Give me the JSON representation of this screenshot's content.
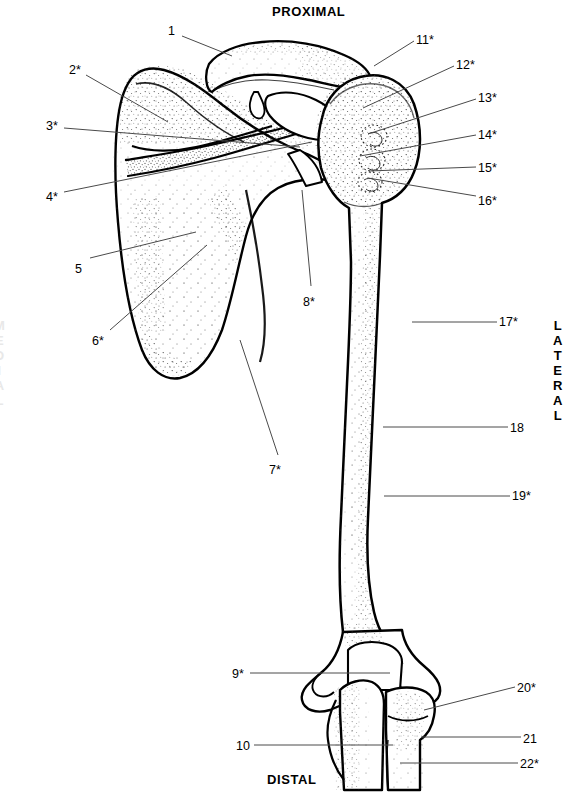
{
  "figure": {
    "title_orientation_top": "PROXIMAL",
    "title_orientation_bottom": "DISTAL",
    "orientation_right": "LATERAL",
    "orientation_left": "MEDIAL",
    "ink_color": "#000000",
    "background_color": "#ffffff"
  },
  "callouts": [
    {
      "id": "c1",
      "label": "1",
      "x": 168,
      "y": 24,
      "leader": [
        [
          182,
          36
        ],
        [
          232,
          56
        ]
      ]
    },
    {
      "id": "c2",
      "label": "2*",
      "x": 69,
      "y": 63,
      "leader": [
        [
          86,
          75
        ],
        [
          168,
          122
        ]
      ]
    },
    {
      "id": "c3",
      "label": "3*",
      "x": 46,
      "y": 119,
      "leader": [
        [
          64,
          128
        ],
        [
          300,
          147
        ]
      ]
    },
    {
      "id": "c4",
      "label": "4*",
      "x": 46,
      "y": 190,
      "leader": [
        [
          64,
          192
        ],
        [
          312,
          142
        ]
      ]
    },
    {
      "id": "c5",
      "label": "5",
      "x": 75,
      "y": 262,
      "leader": [
        [
          90,
          258
        ],
        [
          196,
          232
        ]
      ]
    },
    {
      "id": "c6",
      "label": "6*",
      "x": 92,
      "y": 334,
      "leader": [
        [
          110,
          330
        ],
        [
          207,
          245
        ]
      ]
    },
    {
      "id": "c7",
      "label": "7*",
      "x": 269,
      "y": 463,
      "leader": [
        [
          278,
          455
        ],
        [
          240,
          340
        ]
      ]
    },
    {
      "id": "c8",
      "label": "8*",
      "x": 303,
      "y": 295,
      "leader": [
        [
          311,
          286
        ],
        [
          302,
          190
        ]
      ]
    },
    {
      "id": "c9",
      "label": "9*",
      "x": 232,
      "y": 667,
      "leader": [
        [
          250,
          673
        ],
        [
          390,
          673
        ]
      ]
    },
    {
      "id": "c10",
      "label": "10",
      "x": 236,
      "y": 739,
      "leader": [
        [
          254,
          745
        ],
        [
          393,
          745
        ]
      ]
    },
    {
      "id": "c11",
      "label": "11*",
      "x": 416,
      "y": 33,
      "leader": [
        [
          414,
          41
        ],
        [
          374,
          66
        ]
      ]
    },
    {
      "id": "c12",
      "label": "12*",
      "x": 456,
      "y": 58,
      "leader": [
        [
          454,
          66
        ],
        [
          363,
          108
        ]
      ]
    },
    {
      "id": "c13",
      "label": "13*",
      "x": 478,
      "y": 91,
      "leader": [
        [
          476,
          99
        ],
        [
          368,
          134
        ]
      ]
    },
    {
      "id": "c14",
      "label": "14*",
      "x": 478,
      "y": 128,
      "leader": [
        [
          476,
          135
        ],
        [
          360,
          156
        ]
      ]
    },
    {
      "id": "c15",
      "label": "15*",
      "x": 478,
      "y": 161,
      "leader": [
        [
          476,
          167
        ],
        [
          369,
          171
        ]
      ]
    },
    {
      "id": "c16",
      "label": "16*",
      "x": 478,
      "y": 194,
      "leader": [
        [
          476,
          196
        ],
        [
          368,
          178
        ]
      ]
    },
    {
      "id": "c17",
      "label": "17*",
      "x": 499,
      "y": 315,
      "leader": [
        [
          497,
          322
        ],
        [
          412,
          322
        ]
      ]
    },
    {
      "id": "c18",
      "label": "18",
      "x": 510,
      "y": 421,
      "leader": [
        [
          508,
          427
        ],
        [
          383,
          427
        ]
      ]
    },
    {
      "id": "c19",
      "label": "19*",
      "x": 512,
      "y": 489,
      "leader": [
        [
          510,
          496
        ],
        [
          384,
          496
        ]
      ]
    },
    {
      "id": "c20",
      "label": "20*",
      "x": 517,
      "y": 681,
      "leader": [
        [
          515,
          687
        ],
        [
          424,
          710
        ]
      ]
    },
    {
      "id": "c21",
      "label": "21",
      "x": 523,
      "y": 732,
      "leader": [
        [
          521,
          737
        ],
        [
          421,
          737
        ]
      ]
    },
    {
      "id": "c22",
      "label": "22*",
      "x": 520,
      "y": 757,
      "leader": [
        [
          518,
          763
        ],
        [
          400,
          763
        ]
      ]
    }
  ]
}
